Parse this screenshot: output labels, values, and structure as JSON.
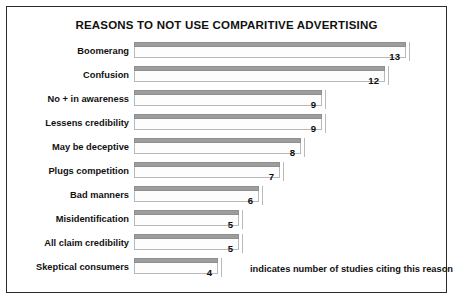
{
  "chart_data": {
    "type": "bar",
    "orientation": "horizontal",
    "title": "REASONS TO NOT USE COMPARITIVE ADVERTISING",
    "xlabel": "",
    "ylabel": "",
    "categories": [
      "Boomerang",
      "Confusion",
      "No + in awareness",
      "Lessens credibility",
      "May be deceptive",
      "Plugs competition",
      "Bad manners",
      "Misidentification",
      "All claim credibility",
      "Skeptical consumers"
    ],
    "values": [
      13,
      12,
      9,
      9,
      8,
      7,
      6,
      5,
      5,
      4
    ],
    "value_labels": [
      "13",
      "12",
      "9",
      "9",
      "8",
      "7",
      "6",
      "5",
      "5",
      "4"
    ],
    "xlim": [
      0,
      14
    ],
    "grid": false,
    "legend": "none",
    "annotation": "indicates number of studies citing this reason",
    "bar_color": "#9d9d9d",
    "bar_body_color": "#fdfdfd",
    "text_color": "#111111",
    "background": "#ffffff",
    "border_color": "#2b2b2b"
  }
}
